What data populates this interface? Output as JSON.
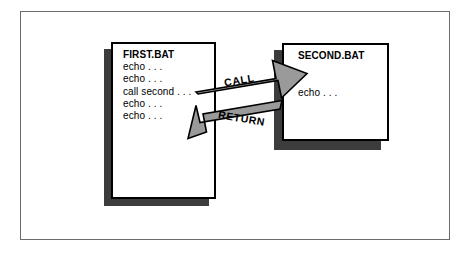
{
  "figure": {
    "name": "batch-file-call-return-diagram",
    "colors": {
      "page_fill": "#ffffff",
      "page_border": "#000000",
      "shadow": "#3c3c3c",
      "arrow_fill": "#9a9a9a",
      "arrow_outline": "#000000",
      "frame_border": "#6b6b6b"
    }
  },
  "documents": [
    {
      "id": "first-bat",
      "title": "FIRST.BAT",
      "lines": [
        "FIRST.BAT",
        "echo . . .",
        "echo . . .",
        "call second . . .",
        "echo . . .",
        "echo . . ."
      ]
    },
    {
      "id": "second-bat",
      "title": "SECOND.BAT",
      "lines": [
        "SECOND.BAT",
        "",
        "",
        "echo . . ."
      ]
    }
  ],
  "arrows": [
    {
      "id": "call-arrow",
      "label": "CALL",
      "direction": "right",
      "from": "FIRST.BAT",
      "to": "SECOND.BAT"
    },
    {
      "id": "return-arrow",
      "label": "RETURN",
      "direction": "left",
      "from": "SECOND.BAT",
      "to": "FIRST.BAT"
    }
  ]
}
